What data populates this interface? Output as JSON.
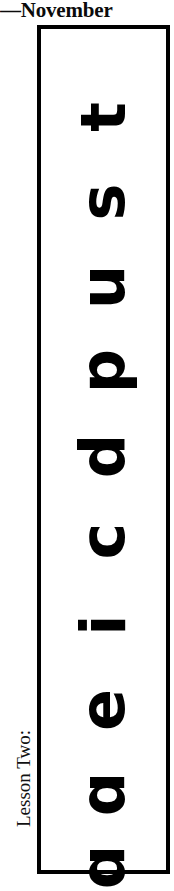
{
  "page": {
    "width": 174,
    "height": 876,
    "background": "#ffffff",
    "ink_color": "#000000"
  },
  "running_head": {
    "text": "—November"
  },
  "side_label": {
    "text": "Lesson Two:",
    "rotation": "-90deg"
  },
  "letter_box": {
    "border_color": "#000000",
    "border_width_px": 4,
    "fill": "#ffffff",
    "letters_top_to_bottom": [
      "t",
      "s",
      "u",
      "p",
      "d",
      "c",
      "i",
      "e",
      "ɑ",
      "ɑ"
    ],
    "letters_reading_order": [
      "ɑ",
      "ɑ",
      "e",
      "i",
      "c",
      "d",
      "p",
      "u",
      "s",
      "t"
    ],
    "letter_rotation": "-90deg",
    "letter_positions_y": [
      46,
      131,
      216,
      300,
      385,
      470,
      554,
      639,
      723,
      796
    ]
  }
}
